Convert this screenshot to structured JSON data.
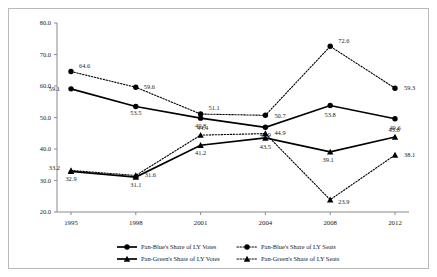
{
  "chart_data": {
    "type": "line",
    "title": "",
    "xlabel": "",
    "ylabel": "",
    "categories": [
      "1995",
      "1998",
      "2001",
      "2004",
      "2008",
      "2012"
    ],
    "ylim": [
      20.0,
      80.0
    ],
    "yticks": [
      "20.0",
      "30.0",
      "40.0",
      "50.0",
      "60.0",
      "70.0",
      "80.0"
    ],
    "grid": false,
    "legend_position": "bottom",
    "series": [
      {
        "name": "Pan-Blue's Share of LY Votes",
        "style": "solid",
        "marker": "circle",
        "color": "#000000",
        "values": [
          59.1,
          53.5,
          49.8,
          46.9,
          53.8,
          49.6
        ],
        "labels": [
          "59.1",
          "53.5",
          "49.8",
          "46.9",
          "53.8",
          "49.6"
        ]
      },
      {
        "name": "Pan-Blue's Share of LY Seats",
        "style": "dotted",
        "marker": "circle",
        "color": "#000000",
        "values": [
          64.6,
          59.6,
          51.1,
          50.7,
          72.6,
          59.3
        ],
        "labels": [
          "64.6",
          "59.6",
          "51.1",
          "50.7",
          "72.6",
          "59.3"
        ]
      },
      {
        "name": "Pan-Green's Share of LY Votes",
        "style": "solid",
        "marker": "triangle",
        "color": "#000000",
        "values": [
          32.9,
          31.1,
          41.2,
          43.5,
          39.1,
          43.8
        ],
        "labels": [
          "32.9",
          "31.1",
          "41.2",
          "43.5",
          "39.1",
          "43.8"
        ]
      },
      {
        "name": "Pan-Green's Share of LY Seats",
        "style": "dotted",
        "marker": "triangle",
        "color": "#000000",
        "values": [
          33.2,
          31.6,
          44.4,
          44.9,
          23.9,
          38.1
        ],
        "labels": [
          "33.2",
          "31.6",
          "44.4",
          "44.9",
          "23.9",
          "38.1"
        ]
      }
    ]
  },
  "legend": {
    "items": [
      "Pan-Blue's Share of LY Votes",
      "Pan-Blue's Share of LY Seats",
      "Pan-Green's Share of LY Votes",
      "Pan-Green's Share of LY Seats"
    ]
  }
}
